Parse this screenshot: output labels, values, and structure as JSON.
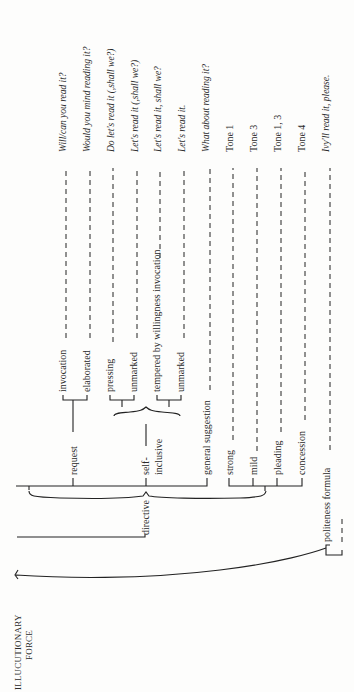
{
  "root": {
    "line1": "ILLUCUTIONARY",
    "line2": "FORCE"
  },
  "nodes": {
    "directive": "directive",
    "request": "request",
    "invocation": "invocation",
    "elaborated": "elaborated",
    "self": "self-",
    "inclusive": "inclusive",
    "pressing": "pressing",
    "unmarked1": "unmarked",
    "tempered": "tempered by willingness invocation",
    "unmarked2": "unmarked",
    "general_suggestion": "general suggestion",
    "strong": "strong",
    "mild": "mild",
    "pleading": "pleading",
    "concession": "concession",
    "politeness_formula": "politeness formula"
  },
  "examples": [
    "Will/can you read it?",
    "Would you mind reading it?",
    "Do let's read it (,shall we?)",
    "Let's read it (,shall we?)",
    "Let's read it, shall we?",
    "Let's read it.",
    "What about reading it?",
    "Tone 1",
    "Tone 3",
    "Tone 1, 3",
    "Tone 4",
    "Ivy'll read it, please."
  ]
}
